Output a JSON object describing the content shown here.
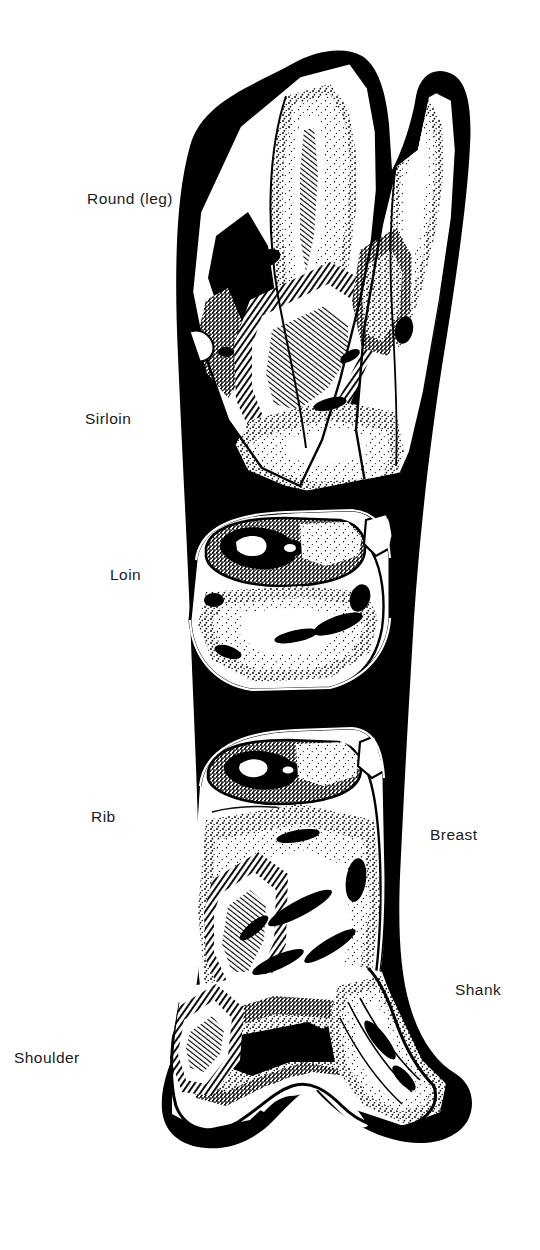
{
  "figure": {
    "style": "black and white pen-and-ink stipple illustration",
    "background_color": "#ffffff",
    "ink_color": "#000000",
    "text_color": "#1b1b1b",
    "width": 540,
    "height": 1250
  },
  "labels": {
    "round": "Round (leg)",
    "sirloin": "Sirloin",
    "loin": "Loin",
    "rib": "Rib",
    "breast": "Breast",
    "shank": "Shank",
    "shoulder": "Shoulder"
  },
  "cuts": [
    {
      "id": "round",
      "name": "Round (leg)",
      "side": "left",
      "x": 87,
      "y": 191
    },
    {
      "id": "sirloin",
      "name": "Sirloin",
      "side": "left",
      "x": 85,
      "y": 411
    },
    {
      "id": "loin",
      "name": "Loin",
      "side": "left",
      "x": 110,
      "y": 567
    },
    {
      "id": "rib",
      "name": "Rib",
      "side": "left",
      "x": 91,
      "y": 809
    },
    {
      "id": "breast",
      "name": "Breast",
      "side": "right",
      "x": 430,
      "y": 827
    },
    {
      "id": "shank",
      "name": "Shank",
      "side": "right",
      "x": 455,
      "y": 982
    },
    {
      "id": "shoulder",
      "name": "Shoulder",
      "side": "left",
      "x": 14,
      "y": 1050
    }
  ]
}
